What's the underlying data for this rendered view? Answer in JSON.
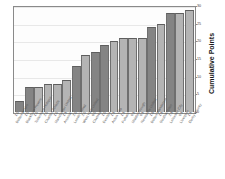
{
  "chart_data": {
    "type": "bar",
    "title": "",
    "xlabel": "",
    "ylabel": "Cumulative Points",
    "ylim": [
      0,
      30
    ],
    "yticks": [
      0,
      5,
      10,
      15,
      20,
      25,
      30
    ],
    "grid": true,
    "legend": "none",
    "categories": [
      "Bolton Wndrs",
      "Blackburn Rovers",
      "Tottenham Hotspur",
      "Charlton Athletic",
      "Manchester United",
      "Arsenal",
      "Leeds United",
      "West Ham United",
      "Chelsea",
      "Everton",
      "Aston Villa",
      "Fulham",
      "Middlesbrough",
      "Newcastle United",
      "Bolton Wanderers",
      "Southampton",
      "Leicester City",
      "Liverpool",
      "Derby County"
    ],
    "bar_values": [
      "1.0",
      "1.0",
      "1.0",
      "2.0",
      "1.0",
      "1.1",
      "2.0",
      "2.0",
      "6.0",
      "1.0",
      "1.1",
      "1.1",
      "0.1",
      "0.1",
      "1.6",
      "1.1",
      "2.1",
      "0.1",
      "1.1"
    ],
    "values": [
      3,
      7,
      7,
      8,
      8,
      9,
      13,
      16,
      17,
      19,
      20,
      21,
      21,
      21,
      24,
      25,
      28,
      28,
      29
    ],
    "bar_shades": [
      "dark",
      "dark",
      "light",
      "light",
      "light",
      "light",
      "dark",
      "light",
      "dark",
      "dark",
      "light",
      "light",
      "light",
      "light",
      "dark",
      "light",
      "dark",
      "light",
      "light"
    ]
  }
}
